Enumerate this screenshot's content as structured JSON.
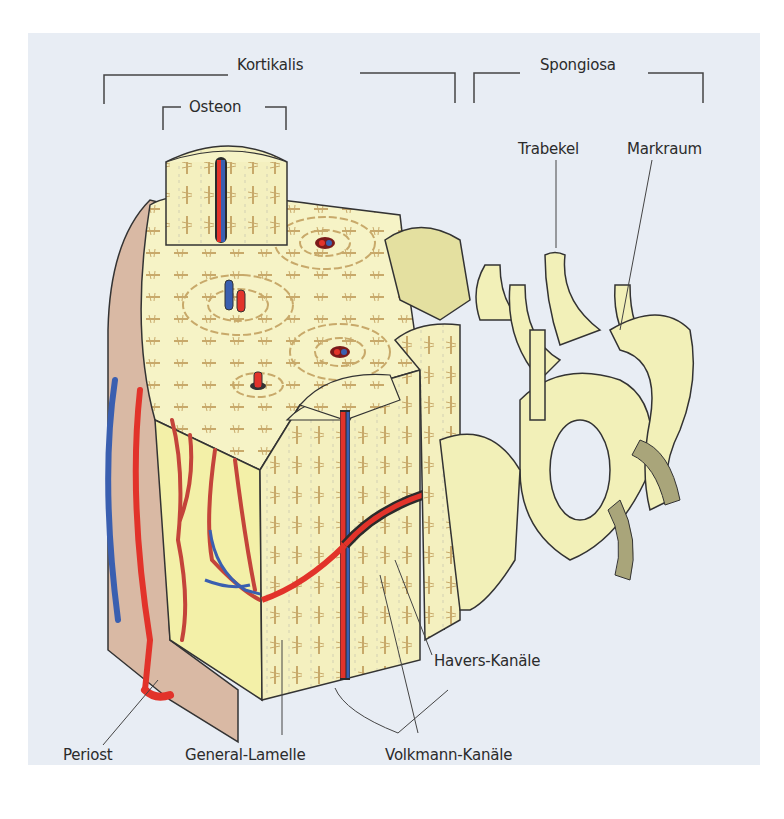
{
  "figure": {
    "colors": {
      "background": "#e8edf4",
      "bone": "#f6f3c6",
      "lamella_cells": "#c8a96a",
      "periost": "#d9b9a4",
      "artery": "#e2332a",
      "vein": "#3a5fb0",
      "line": "#333333"
    }
  },
  "labels": {
    "kortikalis": "Kortikalis",
    "osteon": "Osteon",
    "spongiosa": "Spongiosa",
    "trabekel": "Trabekel",
    "markraum": "Markraum",
    "havers": "Havers-Kanäle",
    "periost": "Periost",
    "general_lamelle": "General-Lamelle",
    "volkmann": "Volkmann-Kanäle"
  }
}
